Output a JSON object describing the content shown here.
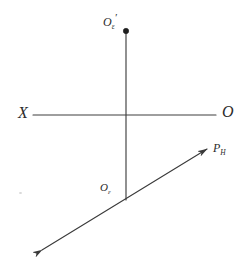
{
  "figure": {
    "background_color": "#ffffff",
    "stroke_color": "#3a3a3a",
    "labels": {
      "x_axis_left": "X",
      "origin_right": "O",
      "point_top_base": "O",
      "point_top_sub": "ε",
      "point_top_prime": "′",
      "point_bottom_base": "O",
      "point_bottom_sub": "ε",
      "trace_base": "P",
      "trace_sub": "H"
    },
    "geometry": {
      "ground_line": {
        "x1": 33,
        "y1": 115,
        "x2": 216,
        "y2": 115
      },
      "vertical_line": {
        "x1": 126,
        "y1": 33,
        "x2": 126,
        "y2": 200
      },
      "trace_line": {
        "x1": 42,
        "y1": 250,
        "x2": 207,
        "y2": 149
      },
      "top_point": {
        "cx": 126,
        "cy": 31,
        "r": 2.6
      },
      "intersection": {
        "x": 126,
        "y": 115
      },
      "foot_point": {
        "x": 126,
        "y": 200
      }
    }
  }
}
